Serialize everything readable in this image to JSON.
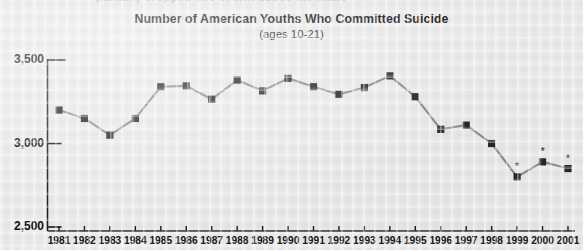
{
  "top_cut_text": "partially cropped line of text above the chart",
  "chart_data": {
    "type": "line",
    "title": "Number of American Youths Who Committed Suicide",
    "subtitle": "(ages 10-21)",
    "xlabel": "",
    "ylabel": "",
    "ylim": [
      2500,
      3500
    ],
    "yticks": [
      2500,
      3000,
      3500
    ],
    "ytick_labels": [
      "2,500",
      "3,000",
      "3,500"
    ],
    "grid": false,
    "legend": "none",
    "marker": "square",
    "marker_color": "#262626",
    "line_color": "#8c8c8c",
    "categories": [
      "1981",
      "1982",
      "1983",
      "1984",
      "1985",
      "1986",
      "1987",
      "1988",
      "1989",
      "1990",
      "1991",
      "1992",
      "1993",
      "1994",
      "1995",
      "1996",
      "1997",
      "1998",
      "1999",
      "2000",
      "2001"
    ],
    "values": [
      3200,
      3150,
      3050,
      3150,
      3340,
      3345,
      3265,
      3380,
      3315,
      3390,
      3340,
      3295,
      3335,
      3405,
      3280,
      3085,
      3110,
      3000,
      2800,
      2890,
      2850
    ],
    "annotations": [
      {
        "category": "1999",
        "symbol": "*"
      },
      {
        "category": "2000",
        "symbol": "*"
      },
      {
        "category": "2001",
        "symbol": "*"
      }
    ]
  }
}
